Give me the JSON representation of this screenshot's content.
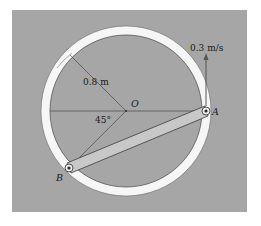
{
  "figure": {
    "colors": {
      "background": "#ffffff",
      "panel": "#a6a6a6",
      "ring": "#f6f6f6",
      "rod": "#c8c8c8",
      "line": "#3a3a3a"
    },
    "labels": {
      "center": "O",
      "point_a": "A",
      "point_b": "B",
      "radius": "0.8 m",
      "angle": "45°",
      "velocity": "0.3 m/s"
    }
  }
}
